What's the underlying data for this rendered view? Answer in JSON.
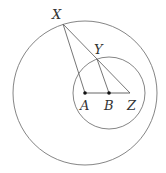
{
  "diagram": {
    "type": "geometry",
    "stroke_color": "#777777",
    "point_color": "#111111",
    "outer_circle": {
      "center": "A",
      "cx": 85,
      "cy": 93,
      "r": 72
    },
    "inner_circle": {
      "center": "B",
      "cx": 109,
      "cy": 93,
      "r": 36
    },
    "points": [
      {
        "name": "X",
        "label": "X",
        "x": 63,
        "y": 24
      },
      {
        "name": "Y",
        "label": "Y",
        "x": 97,
        "y": 59
      },
      {
        "name": "A",
        "label": "A",
        "x": 85,
        "y": 93
      },
      {
        "name": "B",
        "label": "B",
        "x": 109,
        "y": 93
      },
      {
        "name": "Z",
        "label": "Z",
        "x": 130,
        "y": 93
      }
    ],
    "segments": [
      "XA",
      "XZ",
      "YB",
      "AZ"
    ],
    "labels": {
      "X": "X",
      "Y": "Y",
      "A": "A",
      "B": "B",
      "Z": "Z"
    }
  }
}
